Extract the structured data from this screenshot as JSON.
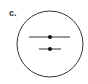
{
  "diagram": {
    "panel_label": "c.",
    "stroke_color": "#333333",
    "circle": {
      "cx": 50,
      "cy": 44,
      "r": 33
    },
    "lines": [
      {
        "name": "upper-segment",
        "x1": 29,
        "x2": 70,
        "y": 37,
        "dot_x": 50
      },
      {
        "name": "lower-segment",
        "x1": 39,
        "x2": 61,
        "y": 49,
        "dot_x": 50
      }
    ]
  }
}
